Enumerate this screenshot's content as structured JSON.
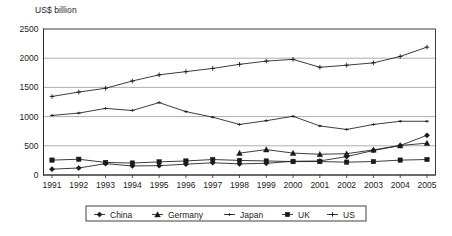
{
  "chart_data": {
    "type": "line",
    "title": "",
    "ylabel": "US$ billion",
    "xlabel": "",
    "ylim": [
      0,
      2500
    ],
    "ytick_values": [
      0,
      500,
      1000,
      1500,
      2000,
      2500
    ],
    "ytick_labels": [
      "0",
      "500",
      "1000",
      "1500",
      "2000",
      "2500"
    ],
    "grid": true,
    "legend_position": "bottom",
    "categories": [
      "1991",
      "1992",
      "1993",
      "1994",
      "1995",
      "1996",
      "1997",
      "1998",
      "1999",
      "2000",
      "2001",
      "2002",
      "2003",
      "2004",
      "2005"
    ],
    "series": [
      {
        "name": "China",
        "marker": "diamond",
        "values": [
          100,
          120,
          195,
          155,
          160,
          185,
          210,
          190,
          200,
          235,
          240,
          315,
          420,
          505,
          680
        ]
      },
      {
        "name": "Germany",
        "marker": "triangle",
        "values": [
          null,
          null,
          null,
          null,
          null,
          null,
          null,
          375,
          435,
          375,
          355,
          365,
          430,
          505,
          545
        ]
      },
      {
        "name": "Japan",
        "marker": "dash",
        "values": [
          1020,
          1060,
          1140,
          1105,
          1240,
          1085,
          990,
          865,
          930,
          1005,
          840,
          780,
          865,
          920,
          920
        ]
      },
      {
        "name": "UK",
        "marker": "square",
        "values": [
          255,
          270,
          215,
          205,
          225,
          240,
          265,
          250,
          240,
          230,
          230,
          220,
          230,
          255,
          265
        ]
      },
      {
        "name": "US",
        "marker": "plus",
        "values": [
          1345,
          1420,
          1485,
          1610,
          1715,
          1770,
          1825,
          1895,
          1950,
          1980,
          1845,
          1880,
          1920,
          2030,
          2190
        ]
      }
    ]
  },
  "legend": {
    "items": [
      {
        "label": "China",
        "marker": "diamond"
      },
      {
        "label": "Germany",
        "marker": "triangle"
      },
      {
        "label": "Japan",
        "marker": "dash"
      },
      {
        "label": "UK",
        "marker": "square"
      },
      {
        "label": "US",
        "marker": "plus"
      }
    ]
  }
}
